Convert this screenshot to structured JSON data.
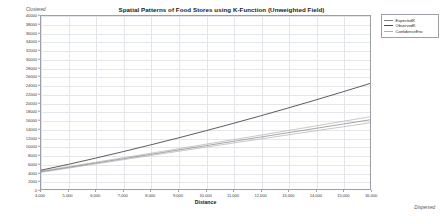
{
  "chart_data": {
    "type": "line",
    "title": "Spatial Patterns of Food Stores using K-Function (Unweighted Field)",
    "xlabel": "Distance",
    "ylabel": "",
    "xlim": [
      4000,
      16000
    ],
    "ylim": [
      0,
      40000
    ],
    "grid": true,
    "legend_position": "top-right",
    "annotations": {
      "top_left": "Clustered",
      "bottom_right": "Dispersed"
    },
    "x_ticks": [
      4000,
      5000,
      6000,
      7000,
      8000,
      9000,
      10000,
      11000,
      12000,
      13000,
      14000,
      15000,
      16000
    ],
    "x_tick_labels": [
      "4,000",
      "5,000",
      "6,000",
      "7,000",
      "8,000",
      "9,000",
      "10,000",
      "11,000",
      "12,000",
      "13,000",
      "14,000",
      "15,000",
      "16,000"
    ],
    "y_ticks": [
      0,
      2000,
      4000,
      6000,
      8000,
      10000,
      12000,
      14000,
      16000,
      18000,
      20000,
      22000,
      24000,
      26000,
      28000,
      30000,
      32000,
      34000,
      36000,
      38000,
      40000
    ],
    "y_tick_labels": [
      "0",
      "2000",
      "4000",
      "6000",
      "8000",
      "10000",
      "12000",
      "14000",
      "16000",
      "18000",
      "20000",
      "22000",
      "24000",
      "26000",
      "28000",
      "30000",
      "32000",
      "34000",
      "36000",
      "38000",
      "40000"
    ],
    "x": [
      4000,
      5000,
      6000,
      7000,
      8000,
      9000,
      10000,
      11000,
      12000,
      13000,
      14000,
      15000,
      16000
    ],
    "series": [
      {
        "name": "ExpectedK",
        "color": "#808080",
        "values": [
          4000,
          5000,
          6000,
          7000,
          8000,
          9000,
          10000,
          11000,
          12000,
          13000,
          14000,
          15000,
          16000
        ]
      },
      {
        "name": "ObservedK",
        "color": "#4a4a4a",
        "values": [
          4350,
          5700,
          7150,
          8650,
          10200,
          11800,
          13450,
          15150,
          16900,
          18700,
          20550,
          22450,
          24400
        ]
      },
      {
        "name": "ConfidenceEnv",
        "color": "#b0b0b0",
        "values": [
          4150,
          5180,
          6200,
          7230,
          8260,
          9300,
          10340,
          11390,
          12440,
          13500,
          14560,
          15630,
          16700
        ]
      },
      {
        "name": "ConfidenceEnvLower",
        "color": "#b0b0b0",
        "values": [
          3850,
          4820,
          5800,
          6770,
          7740,
          8700,
          9660,
          10610,
          11560,
          12500,
          13440,
          14370,
          15300
        ]
      }
    ]
  },
  "legend": {
    "items": [
      {
        "label": "ExpectedK",
        "color": "#808080"
      },
      {
        "label": "ObservedK",
        "color": "#4a4a4a"
      },
      {
        "label": "ConfidenceEnv",
        "color": "#b0b0b0"
      }
    ]
  }
}
